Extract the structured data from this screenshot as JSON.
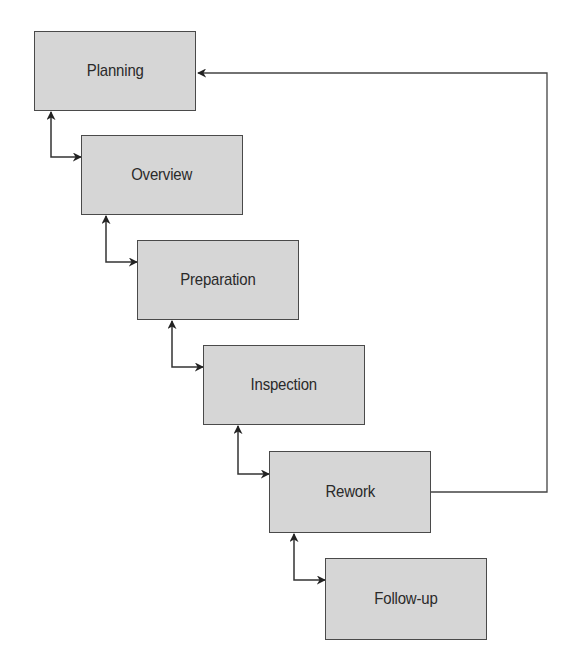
{
  "diagram": {
    "type": "process-flow",
    "nodes": [
      {
        "id": "planning",
        "label": "Planning",
        "x": 34,
        "y": 31
      },
      {
        "id": "overview",
        "label": "Overview",
        "x": 81,
        "y": 135
      },
      {
        "id": "preparation",
        "label": "Preparation",
        "x": 137,
        "y": 240
      },
      {
        "id": "inspection",
        "label": "Inspection",
        "x": 203,
        "y": 345
      },
      {
        "id": "rework",
        "label": "Rework",
        "x": 269,
        "y": 451
      },
      {
        "id": "follow-up",
        "label": "Follow-up",
        "x": 325,
        "y": 558
      }
    ],
    "edges": [
      {
        "from": "planning",
        "to": "overview",
        "bidirectional": true
      },
      {
        "from": "overview",
        "to": "preparation",
        "bidirectional": true
      },
      {
        "from": "preparation",
        "to": "inspection",
        "bidirectional": true
      },
      {
        "from": "inspection",
        "to": "rework",
        "bidirectional": true
      },
      {
        "from": "rework",
        "to": "follow-up",
        "bidirectional": true
      },
      {
        "from": "rework",
        "to": "planning",
        "bidirectional": false,
        "route": "feedback-loop-right"
      }
    ],
    "colors": {
      "box_fill": "#d6d6d6",
      "box_border": "#4a4a4a",
      "line": "#333333",
      "text": "#2a2a2a"
    }
  }
}
